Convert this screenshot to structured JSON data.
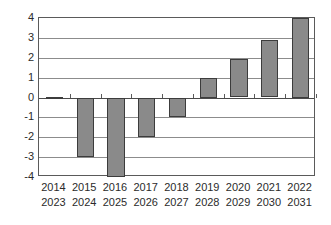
{
  "chart_data": {
    "type": "bar",
    "title": "",
    "subtitle": "",
    "xlabel": "",
    "ylabel": "",
    "categories": [
      "2014",
      "2015",
      "2016",
      "2017",
      "2018",
      "2019",
      "2020",
      "2021",
      "2022"
    ],
    "categories_secondary": [
      "2023",
      "2024",
      "2025",
      "2026",
      "2027",
      "2028",
      "2029",
      "2030",
      "2031"
    ],
    "values": [
      0.03,
      -3.0,
      -4.0,
      -2.0,
      -1.0,
      1.0,
      1.95,
      2.9,
      4.0
    ],
    "ylim": [
      -4,
      4
    ],
    "ytick_labels": [
      "4",
      "3",
      "2",
      "1",
      "0",
      "-1",
      "-2",
      "-3",
      "-4"
    ],
    "ytick_values": [
      4,
      3,
      2,
      1,
      0,
      -1,
      -2,
      -3,
      -4
    ],
    "grid": true,
    "grid_axis": "y",
    "legend": false,
    "legend_position": "none",
    "bar_color": "#8a8a8a",
    "bar_border_color": "#3c3c3c",
    "grid_color": "#8c8c8c",
    "axis_color": "#5a5a5a",
    "background_color": "#ffffff",
    "text_color": "#2b2b2b"
  }
}
